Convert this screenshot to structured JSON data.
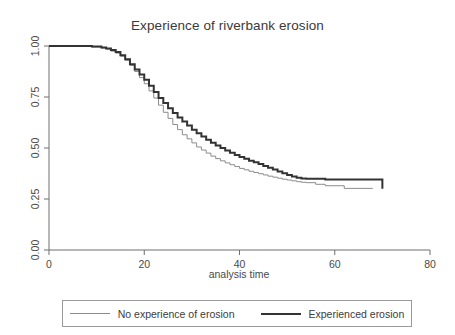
{
  "chart_data": {
    "type": "line",
    "subtype": "kaplan-meier-survival-step",
    "title": "Experience of riverbank erosion",
    "xlabel": "analysis time",
    "ylabel": "",
    "xlim": [
      0,
      80
    ],
    "ylim": [
      0,
      1
    ],
    "xticks": [
      0,
      20,
      40,
      60,
      80
    ],
    "xtick_labels": [
      "0",
      "20",
      "40",
      "60",
      "80"
    ],
    "yticks": [
      0.0,
      0.25,
      0.5,
      0.75,
      1.0
    ],
    "ytick_labels": [
      "0.00",
      "0.25",
      "0.50",
      "0.75",
      "1.00"
    ],
    "grid": false,
    "legend_position": "below-center",
    "series": [
      {
        "name": "No experience of erosion",
        "color": "#8c8c8c",
        "line_width": 1,
        "x": [
          0,
          6,
          9,
          11,
          12,
          13,
          14,
          15,
          16,
          17,
          18,
          19,
          20,
          21,
          22,
          23,
          24,
          25,
          26,
          27,
          28,
          29,
          30,
          31,
          32,
          33,
          34,
          35,
          36,
          37,
          38,
          39,
          40,
          41,
          42,
          43,
          44,
          45,
          46,
          47,
          48,
          49,
          50,
          51,
          52,
          53,
          54,
          56,
          58,
          62,
          68
        ],
        "y": [
          1.0,
          1.0,
          0.995,
          0.99,
          0.985,
          0.975,
          0.965,
          0.95,
          0.93,
          0.905,
          0.875,
          0.845,
          0.815,
          0.78,
          0.745,
          0.71,
          0.675,
          0.645,
          0.615,
          0.59,
          0.565,
          0.545,
          0.525,
          0.505,
          0.49,
          0.475,
          0.46,
          0.448,
          0.437,
          0.427,
          0.418,
          0.409,
          0.4,
          0.393,
          0.386,
          0.38,
          0.374,
          0.368,
          0.362,
          0.357,
          0.352,
          0.347,
          0.343,
          0.339,
          0.335,
          0.332,
          0.33,
          0.322,
          0.315,
          0.302,
          0.302
        ]
      },
      {
        "name": "Experienced erosion",
        "color": "#333333",
        "line_width": 2,
        "x": [
          0,
          6,
          9,
          11,
          12,
          13,
          14,
          15,
          16,
          17,
          18,
          19,
          20,
          21,
          22,
          23,
          24,
          25,
          26,
          27,
          28,
          29,
          30,
          31,
          32,
          33,
          34,
          35,
          36,
          37,
          38,
          39,
          40,
          41,
          42,
          43,
          44,
          45,
          46,
          47,
          48,
          49,
          50,
          51,
          52,
          53,
          54,
          56,
          58,
          62,
          70
        ],
        "y": [
          1.0,
          1.0,
          0.997,
          0.993,
          0.988,
          0.98,
          0.97,
          0.955,
          0.935,
          0.91,
          0.885,
          0.86,
          0.835,
          0.805,
          0.775,
          0.745,
          0.72,
          0.695,
          0.672,
          0.65,
          0.63,
          0.61,
          0.59,
          0.572,
          0.556,
          0.54,
          0.526,
          0.512,
          0.5,
          0.488,
          0.477,
          0.466,
          0.456,
          0.447,
          0.438,
          0.43,
          0.421,
          0.412,
          0.403,
          0.394,
          0.385,
          0.376,
          0.368,
          0.36,
          0.354,
          0.35,
          0.349,
          0.349,
          0.346,
          0.346,
          0.3
        ]
      }
    ]
  },
  "legend": {
    "entries": [
      {
        "label": "No experience of erosion",
        "style": "thin"
      },
      {
        "label": "Experienced erosion",
        "style": "thick"
      }
    ]
  },
  "colors": {
    "axis": "#6e6e6e",
    "text": "#3c3c3c",
    "series_thin": "#8c8c8c",
    "series_thick": "#333333",
    "background": "#ffffff",
    "legend_border": "#9a9a9a"
  }
}
